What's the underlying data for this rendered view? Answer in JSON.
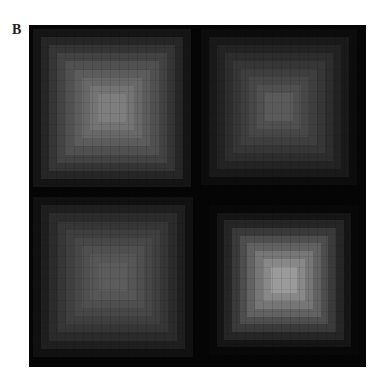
{
  "panel": {
    "label": "B"
  },
  "figure": {
    "quadrants": [
      {
        "id": "top-left",
        "x": 4,
        "y": 4,
        "size": 158,
        "levels": [
          "#151515",
          "#262626",
          "#353535",
          "#434343",
          "#505050",
          "#5c5c5c",
          "#686868",
          "#747474",
          "#7e7e7e"
        ]
      },
      {
        "id": "top-right",
        "x": 172,
        "y": 4,
        "size": 156,
        "levels": [
          "#0c0c0c",
          "#191919",
          "#232323",
          "#2d2d2d",
          "#363636",
          "#3e3e3e",
          "#474747",
          "#505050",
          "#5a5a5a"
        ]
      },
      {
        "id": "bottom-left",
        "x": 4,
        "y": 172,
        "size": 160,
        "levels": [
          "#111111",
          "#1f1f1f",
          "#2b2b2b",
          "#363636",
          "#3f3f3f",
          "#474747",
          "#4f4f4f",
          "#565656",
          "#5c5c5c"
        ]
      },
      {
        "id": "bottom-right",
        "x": 180,
        "y": 180,
        "size": 150,
        "levels": [
          "#080808",
          "#151515",
          "#262626",
          "#3a3a3a",
          "#4e4e4e",
          "#626262",
          "#767676",
          "#888888",
          "#9a9a9a"
        ]
      }
    ]
  }
}
